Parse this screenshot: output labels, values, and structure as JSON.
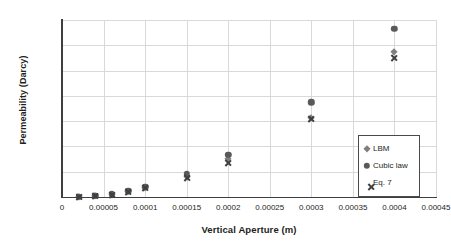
{
  "chart_data": {
    "type": "scatter",
    "title": "",
    "xlabel": "Vertical Aperture (m)",
    "ylabel": "Permeability (Darcy)",
    "xlim": [
      0,
      0.00045
    ],
    "ylim": [
      0,
      14000
    ],
    "grid": true,
    "legend_position": "bottom-right",
    "x": [
      2e-05,
      4e-05,
      6e-05,
      8e-05,
      0.0001,
      0.00015,
      0.0002,
      0.0003,
      0.0004
    ],
    "series": [
      {
        "name": "LBM",
        "marker": "diamond",
        "color": "#7f7f7f",
        "values": [
          20,
          70,
          180,
          400,
          700,
          1600,
          3000,
          6250,
          11500
        ]
      },
      {
        "name": "Cubic law",
        "marker": "circle",
        "color": "#595959",
        "values": [
          30,
          90,
          230,
          480,
          810,
          1850,
          3350,
          7480,
          13300
        ]
      },
      {
        "name": "Eq. 7",
        "marker": "x",
        "color": "#3f3f3f",
        "values": [
          20,
          70,
          170,
          380,
          680,
          1540,
          2700,
          6180,
          11020
        ]
      }
    ],
    "x_ticks": [
      {
        "value": 0,
        "label": "0"
      },
      {
        "value": 5e-05,
        "label": "0.00005"
      },
      {
        "value": 0.0001,
        "label": "0.0001"
      },
      {
        "value": 0.00015,
        "label": "0.00015"
      },
      {
        "value": 0.0002,
        "label": "0.0002"
      },
      {
        "value": 0.00025,
        "label": "0.00025"
      },
      {
        "value": 0.0003,
        "label": "0.0003"
      },
      {
        "value": 0.00035,
        "label": "0.00035"
      },
      {
        "value": 0.0004,
        "label": "0.0004"
      },
      {
        "value": 0.00045,
        "label": "0.00045"
      }
    ],
    "y_ticks": [
      {
        "value": 0,
        "label": "0"
      },
      {
        "value": 2000,
        "label": "2000"
      },
      {
        "value": 4000,
        "label": "4000"
      },
      {
        "value": 6000,
        "label": "6000"
      },
      {
        "value": 8000,
        "label": "8000"
      },
      {
        "value": 10000,
        "label": "10000"
      },
      {
        "value": 12000,
        "label": "12000"
      },
      {
        "value": 14000,
        "label": "14000"
      }
    ]
  },
  "legend": {
    "items": [
      {
        "label": "LBM",
        "marker": "diamond"
      },
      {
        "label": "Cubic law",
        "marker": "circle"
      },
      {
        "label": "Eq. 7",
        "marker": "x"
      }
    ]
  },
  "colors": {
    "axis": "#3f3f3f",
    "grid": "#d9d9d9",
    "text": "#231f20",
    "background": "#ffffff"
  }
}
